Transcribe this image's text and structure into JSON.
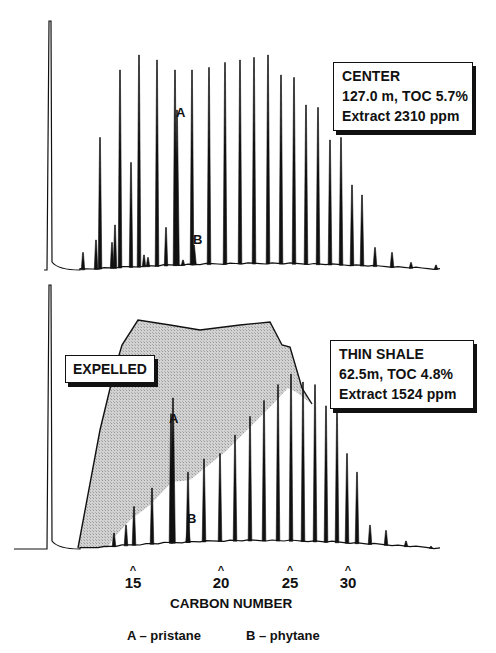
{
  "chart_data": [
    {
      "type": "line",
      "title": "CENTER",
      "panel": "top",
      "annotation_lines": [
        "CENTER",
        "127.0m, TOC 5.7%",
        "Extract 2310 ppm"
      ],
      "sample": {
        "name": "CENTER",
        "depth_m": 127.0,
        "toc_percent": 5.7,
        "extract_ppm": 2310
      },
      "xlabel": "CARBON NUMBER",
      "ylabel": "",
      "x_ticks": [
        15,
        20,
        25,
        30
      ],
      "grid": false,
      "solvent_peak": {
        "x": 50,
        "height": 0.98
      },
      "n_alkane_peaks": [
        {
          "carbon": 13,
          "x": 100,
          "height": 0.53
        },
        {
          "carbon": 14,
          "x": 120,
          "height": 0.8
        },
        {
          "carbon": 15,
          "x": 139,
          "height": 0.86
        },
        {
          "carbon": 16,
          "x": 157,
          "height": 0.84
        },
        {
          "carbon": 17,
          "x": 175,
          "height": 0.8
        },
        {
          "carbon": 18,
          "x": 192,
          "height": 0.8
        },
        {
          "carbon": 19,
          "x": 209,
          "height": 0.81
        },
        {
          "carbon": 20,
          "x": 225,
          "height": 0.83
        },
        {
          "carbon": 21,
          "x": 240,
          "height": 0.84
        },
        {
          "carbon": 22,
          "x": 254,
          "height": 0.85
        },
        {
          "carbon": 23,
          "x": 268,
          "height": 0.86
        },
        {
          "carbon": 24,
          "x": 281,
          "height": 0.78
        },
        {
          "carbon": 25,
          "x": 294,
          "height": 0.77
        },
        {
          "carbon": 26,
          "x": 306,
          "height": 0.66
        },
        {
          "carbon": 27,
          "x": 318,
          "height": 0.65
        },
        {
          "carbon": 28,
          "x": 330,
          "height": 0.52
        },
        {
          "carbon": 29,
          "x": 341,
          "height": 0.53
        },
        {
          "carbon": 30,
          "x": 352,
          "height": 0.34
        },
        {
          "carbon": 31,
          "x": 362,
          "height": 0.3
        },
        {
          "carbon": 32,
          "x": 375,
          "height": 0.09
        },
        {
          "carbon": 33,
          "x": 392,
          "height": 0.07
        },
        {
          "carbon": 34,
          "x": 411,
          "height": 0.03
        },
        {
          "carbon": 35,
          "x": 436,
          "height": 0.02
        }
      ],
      "isoprenoids": [
        {
          "label": "A",
          "name": "pristane",
          "x": 177,
          "height": 0.64
        },
        {
          "label": "B",
          "name": "phytane",
          "x": 194,
          "height": 0.1
        }
      ],
      "minor_peaks": [
        {
          "x": 83,
          "height": 0.07
        },
        {
          "x": 96,
          "height": 0.12
        },
        {
          "x": 112,
          "height": 0.11
        },
        {
          "x": 115,
          "height": 0.18
        },
        {
          "x": 131,
          "height": 0.43
        },
        {
          "x": 144,
          "height": 0.06
        },
        {
          "x": 148,
          "height": 0.05
        },
        {
          "x": 166,
          "height": 0.17
        },
        {
          "x": 183,
          "height": 0.04
        }
      ]
    },
    {
      "type": "line",
      "title": "THIN SHALE",
      "panel": "bottom",
      "annotation_lines": [
        "THIN SHALE",
        "62.5m, TOC 4.8%",
        "Extract 1524 ppm"
      ],
      "sample": {
        "name": "THIN SHALE",
        "depth_m": 62.5,
        "toc_percent": 4.8,
        "extract_ppm": 1524
      },
      "shaded_region_label": "EXPELLED",
      "xlabel": "CARBON NUMBER",
      "x_ticks": [
        15,
        20,
        25,
        30
      ],
      "grid": false,
      "solvent_peak": {
        "x": 50,
        "height": 0.98
      },
      "n_alkane_peaks": [
        {
          "carbon": 13,
          "x": 114,
          "height": 0.06
        },
        {
          "carbon": 14,
          "x": 126,
          "height": 0.09
        },
        {
          "carbon": 15,
          "x": 134,
          "height": 0.16
        },
        {
          "carbon": 16,
          "x": 152,
          "height": 0.23
        },
        {
          "carbon": 17,
          "x": 171,
          "height": 0.51
        },
        {
          "carbon": 18,
          "x": 188,
          "height": 0.29
        },
        {
          "carbon": 19,
          "x": 204,
          "height": 0.34
        },
        {
          "carbon": 20,
          "x": 220,
          "height": 0.36
        },
        {
          "carbon": 21,
          "x": 235,
          "height": 0.43
        },
        {
          "carbon": 22,
          "x": 250,
          "height": 0.5
        },
        {
          "carbon": 23,
          "x": 264,
          "height": 0.56
        },
        {
          "carbon": 24,
          "x": 278,
          "height": 0.62
        },
        {
          "carbon": 25,
          "x": 291,
          "height": 0.66
        },
        {
          "carbon": 26,
          "x": 303,
          "height": 0.63
        },
        {
          "carbon": 27,
          "x": 315,
          "height": 0.62
        },
        {
          "carbon": 28,
          "x": 326,
          "height": 0.54
        },
        {
          "carbon": 29,
          "x": 337,
          "height": 0.52
        },
        {
          "carbon": 30,
          "x": 347,
          "height": 0.36
        },
        {
          "carbon": 31,
          "x": 357,
          "height": 0.29
        },
        {
          "carbon": 32,
          "x": 370,
          "height": 0.09
        },
        {
          "carbon": 33,
          "x": 386,
          "height": 0.07
        },
        {
          "carbon": 34,
          "x": 406,
          "height": 0.03
        },
        {
          "carbon": 35,
          "x": 431,
          "height": 0.01
        }
      ],
      "isoprenoids": [
        {
          "label": "A",
          "name": "pristane",
          "x": 173,
          "height": 0.57
        },
        {
          "label": "B",
          "name": "phytane",
          "x": 188,
          "height": 0.08
        }
      ],
      "expelled_envelope_x_y": [
        [
          78,
          548
        ],
        [
          100,
          430
        ],
        [
          114,
          372
        ],
        [
          122,
          345
        ],
        [
          138,
          320
        ],
        [
          170,
          325
        ],
        [
          200,
          330
        ],
        [
          240,
          325
        ],
        [
          270,
          322
        ],
        [
          282,
          345
        ],
        [
          290,
          347
        ],
        [
          302,
          388
        ],
        [
          312,
          404
        ],
        [
          296,
          392
        ],
        [
          288,
          388
        ],
        [
          272,
          405
        ],
        [
          225,
          452
        ],
        [
          190,
          480
        ],
        [
          172,
          482
        ],
        [
          150,
          505
        ],
        [
          130,
          520
        ],
        [
          112,
          540
        ],
        [
          108,
          548
        ]
      ]
    }
  ],
  "axis": {
    "ticks": [
      {
        "label": "15",
        "x": 133
      },
      {
        "label": "20",
        "x": 221
      },
      {
        "label": "25",
        "x": 290
      },
      {
        "label": "30",
        "x": 348
      }
    ],
    "caret": "^",
    "xlabel": "CARBON NUMBER"
  },
  "legend": {
    "a": "A – pristane",
    "b": "B – phytane"
  },
  "labels": {
    "peak_a": "A",
    "peak_b": "B",
    "expelled": "EXPELLED"
  },
  "top_box": {
    "line1": "CENTER",
    "line2": "127.0 m, TOC 5.7%",
    "line3": "Extract 2310 ppm"
  },
  "bottom_box": {
    "line1": "THIN SHALE",
    "line2": "62.5m, TOC 4.8%",
    "line3": "Extract 1524 ppm"
  },
  "colors": {
    "ink": "#111111",
    "shade": "#c8c8c8",
    "background": "#ffffff"
  }
}
